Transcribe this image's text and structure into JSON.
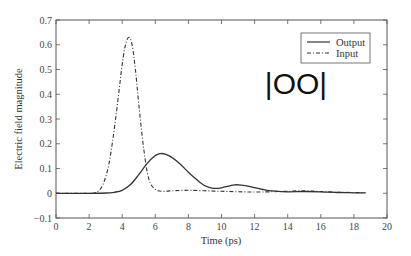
{
  "chart_data": {
    "type": "line",
    "title": "",
    "xlabel": "Time (ps)",
    "ylabel": "Electric field magnitude",
    "xlim": [
      0,
      20
    ],
    "ylim": [
      -0.1,
      0.7
    ],
    "xticks": [
      0,
      2,
      4,
      6,
      8,
      10,
      12,
      14,
      16,
      18,
      20
    ],
    "yticks": [
      -0.1,
      0,
      0.1,
      0.2,
      0.3,
      0.4,
      0.5,
      0.6,
      0.7
    ],
    "xtick_labels": [
      "0",
      "2",
      "4",
      "6",
      "8",
      "10",
      "12",
      "14",
      "16",
      "18",
      "20"
    ],
    "ytick_labels": [
      "−0.1",
      "0",
      "0.1",
      "0.2",
      "0.3",
      "0.4",
      "0.5",
      "0.6",
      "0.7"
    ],
    "grid": false,
    "legend_position": "upper right",
    "annotation": "|OO|",
    "series": [
      {
        "name": "Output",
        "style": "solid",
        "x": [
          0,
          2,
          3,
          3.5,
          4,
          4.5,
          5,
          5.5,
          6,
          6.3,
          6.6,
          7,
          7.5,
          8,
          8.5,
          9,
          9.5,
          10,
          10.5,
          10.8,
          11.2,
          11.8,
          12.5,
          13,
          14,
          15,
          16,
          17,
          18,
          18.7
        ],
        "y": [
          0,
          0,
          0.001,
          0.004,
          0.012,
          0.035,
          0.075,
          0.12,
          0.152,
          0.16,
          0.158,
          0.145,
          0.118,
          0.085,
          0.055,
          0.03,
          0.02,
          0.022,
          0.03,
          0.034,
          0.033,
          0.026,
          0.015,
          0.01,
          0.006,
          0.007,
          0.006,
          0.003,
          0.002,
          0.002
        ]
      },
      {
        "name": "Input",
        "style": "dashdot",
        "x": [
          0,
          2,
          2.4,
          2.8,
          3.2,
          3.6,
          4.0,
          4.2,
          4.4,
          4.6,
          4.8,
          5.0,
          5.3,
          5.6,
          6.0,
          6.5,
          7,
          8,
          9,
          10,
          11,
          12,
          13,
          14,
          15,
          16,
          17,
          18,
          18.7
        ],
        "y": [
          0,
          0,
          0.003,
          0.03,
          0.12,
          0.3,
          0.52,
          0.6,
          0.63,
          0.6,
          0.5,
          0.36,
          0.18,
          0.06,
          0.015,
          0.008,
          0.01,
          0.012,
          0.01,
          0.008,
          0.006,
          0.005,
          0.006,
          0.008,
          0.01,
          0.007,
          0.004,
          0.003,
          0.002
        ]
      }
    ]
  },
  "legend": {
    "items": [
      {
        "label": "Output",
        "style": "solid"
      },
      {
        "label": "Input",
        "style": "dashdot"
      }
    ]
  },
  "colors": {
    "axis": "#555555",
    "line": "#333333",
    "background": "#ffffff"
  }
}
